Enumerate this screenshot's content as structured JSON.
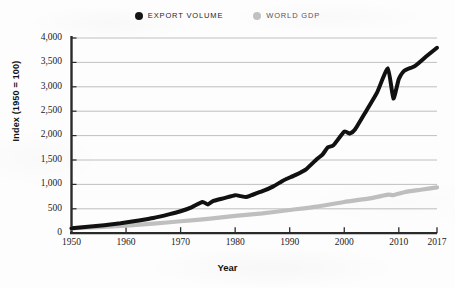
{
  "chart_data": {
    "type": "line",
    "title": "",
    "subtitle": "",
    "xlabel": "Year",
    "ylabel": "Index (1950 = 100)",
    "xlim": [
      1950,
      2017
    ],
    "ylim": [
      0,
      4000
    ],
    "grid": "horizontal",
    "legend_position": "top-center",
    "xticks": [
      "1950",
      "1960",
      "1970",
      "1980",
      "1990",
      "2000",
      "2010",
      "2017"
    ],
    "xtick_values": [
      1950,
      1960,
      1970,
      1980,
      1990,
      2000,
      2010,
      2017
    ],
    "yticks": [
      "0",
      "500",
      "1,000",
      "1,500",
      "2,000",
      "2,500",
      "3,000",
      "3,500",
      "4,000"
    ],
    "ytick_values": [
      0,
      500,
      1000,
      1500,
      2000,
      2500,
      3000,
      3500,
      4000
    ],
    "series": [
      {
        "name": "EXPORT VOLUME",
        "color": "#111111",
        "marker": "dot",
        "x": [
          1950,
          1953,
          1956,
          1959,
          1962,
          1965,
          1968,
          1970,
          1972,
          1974,
          1975,
          1976,
          1978,
          1980,
          1981,
          1982,
          1983,
          1985,
          1987,
          1989,
          1991,
          1993,
          1995,
          1996,
          1997,
          1998,
          2000,
          2001,
          2002,
          2004,
          2006,
          2008,
          2009,
          2010,
          2011,
          2013,
          2015,
          2017
        ],
        "values": [
          100,
          130,
          165,
          205,
          255,
          310,
          390,
          450,
          530,
          640,
          590,
          660,
          720,
          780,
          760,
          740,
          780,
          860,
          960,
          1090,
          1190,
          1310,
          1520,
          1610,
          1760,
          1800,
          2080,
          2040,
          2130,
          2500,
          2880,
          3380,
          2760,
          3160,
          3330,
          3430,
          3620,
          3800
        ]
      },
      {
        "name": "WORLD GDP",
        "color": "#bfbfbf",
        "marker": "dot",
        "x": [
          1950,
          1955,
          1960,
          1965,
          1970,
          1975,
          1980,
          1985,
          1990,
          1995,
          2000,
          2005,
          2008,
          2009,
          2011,
          2014,
          2017
        ],
        "values": [
          100,
          125,
          155,
          195,
          245,
          295,
          355,
          405,
          475,
          545,
          640,
          720,
          790,
          780,
          840,
          890,
          940
        ]
      }
    ]
  },
  "legend": {
    "items": [
      {
        "label": "EXPORT VOLUME",
        "color": "#141414"
      },
      {
        "label": "WORLD GDP",
        "color": "#c2c2c2"
      }
    ]
  },
  "axes": {
    "y_title": "Index (1950 = 100)",
    "x_title": "Year"
  }
}
